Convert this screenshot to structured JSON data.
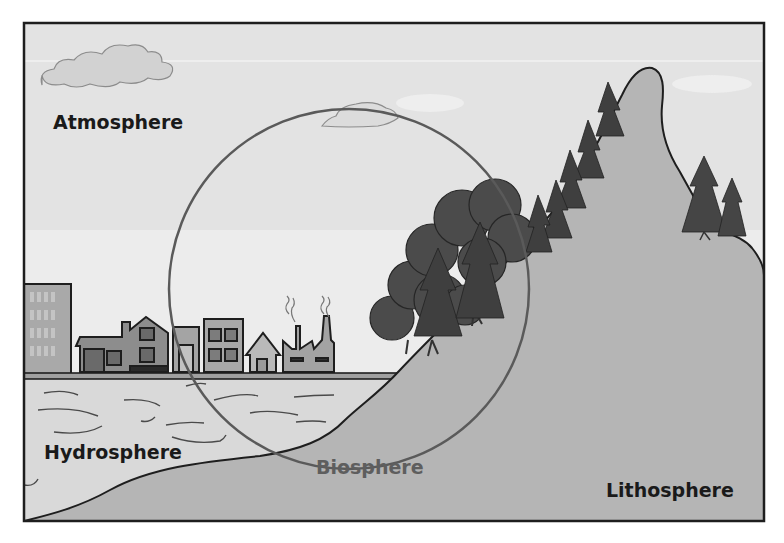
{
  "diagram": {
    "labels": {
      "atmosphere": "Atmosphere",
      "hydrosphere": "Hydrosphere",
      "biosphere": "Biosphere",
      "lithosphere": "Lithosphere"
    },
    "elements": {
      "clouds": [
        "cloud-top-left",
        "cloud-center",
        "cloud-right-faint"
      ],
      "city": [
        "office-tower",
        "house-with-garage",
        "narrow-building",
        "apartment-building",
        "small-house",
        "factory-with-smokestacks"
      ],
      "vegetation": [
        "deciduous-tree-cluster",
        "pine-trees-on-slope",
        "pine-trees-on-ridge"
      ],
      "landforms": [
        "mountain-peak",
        "shoreline-slope"
      ],
      "water": "lake-with-ripples",
      "overlay": "biosphere-circle"
    },
    "colors": {
      "sky": "#e2e2e2",
      "water": "#d9d9d9",
      "land": "#b4b4b4",
      "trees": "#4a4a4a",
      "circle": "#5a5a5a",
      "frame": "#1e1e1e",
      "label_text": "#1a1a1a",
      "biosphere_text": "#5e5e5e"
    }
  }
}
